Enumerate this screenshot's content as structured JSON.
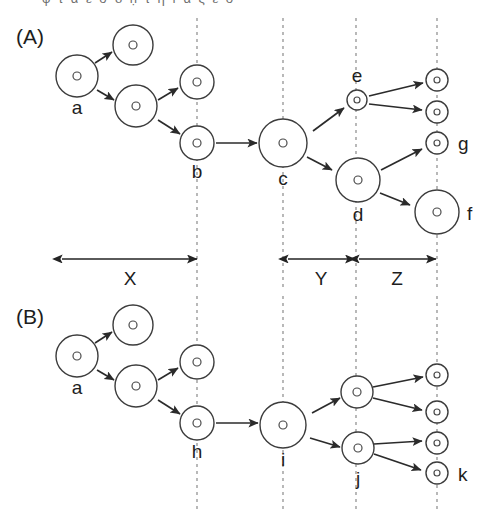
{
  "figure": {
    "width": 491,
    "height": 510,
    "background": "#ffffff",
    "stroke_color": "#2b2b2b",
    "guide_color": "#8a8a8a",
    "clipped_header_text": "φ  τ  α  ε  σ  δ ḥ τ η ı α ς ε σ"
  },
  "panels": [
    {
      "id": "A",
      "label": "(A)",
      "label_x": 16,
      "label_y": 44,
      "cells": [
        {
          "name": "a",
          "cx": 77,
          "cy": 76,
          "r": 21,
          "nr": 4,
          "label": "a",
          "label_x": 77,
          "label_y": 114,
          "label_anchor": "middle"
        },
        {
          "name": "a-up",
          "cx": 133,
          "cy": 45,
          "r": 20,
          "nr": 4,
          "label": "",
          "label_x": 0,
          "label_y": 0,
          "label_anchor": "middle"
        },
        {
          "name": "a-down",
          "cx": 136,
          "cy": 106,
          "r": 21,
          "nr": 4,
          "label": "",
          "label_x": 0,
          "label_y": 0,
          "label_anchor": "middle"
        },
        {
          "name": "b-sister",
          "cx": 197,
          "cy": 82,
          "r": 17,
          "nr": 4,
          "label": "",
          "label_x": 0,
          "label_y": 0,
          "label_anchor": "middle"
        },
        {
          "name": "b",
          "cx": 197,
          "cy": 143,
          "r": 17,
          "nr": 4,
          "label": "b",
          "label_x": 197,
          "label_y": 178,
          "label_anchor": "middle"
        },
        {
          "name": "c",
          "cx": 283,
          "cy": 143,
          "r": 24,
          "nr": 4,
          "label": "c",
          "label_x": 283,
          "label_y": 185,
          "label_anchor": "middle"
        },
        {
          "name": "e",
          "cx": 357,
          "cy": 100,
          "r": 10,
          "nr": 3,
          "label": "e",
          "label_x": 357,
          "label_y": 82,
          "label_anchor": "middle"
        },
        {
          "name": "d",
          "cx": 358,
          "cy": 180,
          "r": 22,
          "nr": 4,
          "label": "d",
          "label_x": 358,
          "label_y": 221,
          "label_anchor": "middle"
        },
        {
          "name": "e-up",
          "cx": 437,
          "cy": 80,
          "r": 11,
          "nr": 3,
          "label": "",
          "label_x": 0,
          "label_y": 0,
          "label_anchor": "middle"
        },
        {
          "name": "e-down",
          "cx": 437,
          "cy": 112,
          "r": 11,
          "nr": 3,
          "label": "",
          "label_x": 0,
          "label_y": 0,
          "label_anchor": "middle"
        },
        {
          "name": "g",
          "cx": 437,
          "cy": 143,
          "r": 11,
          "nr": 3,
          "label": "g",
          "label_x": 458,
          "label_y": 150,
          "label_anchor": "start"
        },
        {
          "name": "f",
          "cx": 437,
          "cy": 212,
          "r": 22,
          "nr": 4,
          "label": "f",
          "label_x": 467,
          "label_y": 220,
          "label_anchor": "start"
        }
      ],
      "arrows": [
        {
          "name": "a-to-up",
          "x1": 95,
          "y1": 63,
          "x2": 112,
          "y2": 52
        },
        {
          "name": "a-to-down",
          "x1": 97,
          "y1": 90,
          "x2": 114,
          "y2": 100
        },
        {
          "name": "to-b-sister",
          "x1": 158,
          "y1": 100,
          "x2": 178,
          "y2": 88
        },
        {
          "name": "to-b",
          "x1": 158,
          "y1": 120,
          "x2": 180,
          "y2": 134
        },
        {
          "name": "b-to-c",
          "x1": 216,
          "y1": 143,
          "x2": 257,
          "y2": 143
        },
        {
          "name": "c-to-e",
          "x1": 313,
          "y1": 131,
          "x2": 344,
          "y2": 108
        },
        {
          "name": "c-to-d",
          "x1": 307,
          "y1": 157,
          "x2": 332,
          "y2": 170
        },
        {
          "name": "e-to-up",
          "x1": 369,
          "y1": 96,
          "x2": 423,
          "y2": 83
        },
        {
          "name": "e-to-down",
          "x1": 369,
          "y1": 104,
          "x2": 422,
          "y2": 110
        },
        {
          "name": "d-to-g",
          "x1": 381,
          "y1": 170,
          "x2": 422,
          "y2": 149
        },
        {
          "name": "d-to-f",
          "x1": 380,
          "y1": 193,
          "x2": 410,
          "y2": 205
        }
      ]
    },
    {
      "id": "B",
      "label": "(B)",
      "label_x": 16,
      "label_y": 324,
      "cells": [
        {
          "name": "a",
          "cx": 77,
          "cy": 356,
          "r": 21,
          "nr": 4,
          "label": "a",
          "label_x": 77,
          "label_y": 394,
          "label_anchor": "middle"
        },
        {
          "name": "a-up",
          "cx": 133,
          "cy": 325,
          "r": 20,
          "nr": 4,
          "label": "",
          "label_x": 0,
          "label_y": 0,
          "label_anchor": "middle"
        },
        {
          "name": "a-down",
          "cx": 136,
          "cy": 386,
          "r": 21,
          "nr": 4,
          "label": "",
          "label_x": 0,
          "label_y": 0,
          "label_anchor": "middle"
        },
        {
          "name": "h-sister",
          "cx": 197,
          "cy": 362,
          "r": 17,
          "nr": 4,
          "label": "",
          "label_x": 0,
          "label_y": 0,
          "label_anchor": "middle"
        },
        {
          "name": "h",
          "cx": 197,
          "cy": 423,
          "r": 17,
          "nr": 4,
          "label": "h",
          "label_x": 197,
          "label_y": 458,
          "label_anchor": "middle"
        },
        {
          "name": "i",
          "cx": 283,
          "cy": 425,
          "r": 23,
          "nr": 4,
          "label": "i",
          "label_x": 283,
          "label_y": 466,
          "label_anchor": "middle"
        },
        {
          "name": "j-sister",
          "cx": 357,
          "cy": 392,
          "r": 16,
          "nr": 4,
          "label": "",
          "label_x": 0,
          "label_y": 0,
          "label_anchor": "middle"
        },
        {
          "name": "j",
          "cx": 358,
          "cy": 448,
          "r": 16,
          "nr": 4,
          "label": "j",
          "label_x": 358,
          "label_y": 485,
          "label_anchor": "middle"
        },
        {
          "name": "j-s-up",
          "cx": 437,
          "cy": 375,
          "r": 11,
          "nr": 3,
          "label": "",
          "label_x": 0,
          "label_y": 0,
          "label_anchor": "middle"
        },
        {
          "name": "j-s-down",
          "cx": 437,
          "cy": 412,
          "r": 11,
          "nr": 3,
          "label": "",
          "label_x": 0,
          "label_y": 0,
          "label_anchor": "middle"
        },
        {
          "name": "j-up",
          "cx": 437,
          "cy": 443,
          "r": 11,
          "nr": 3,
          "label": "",
          "label_x": 0,
          "label_y": 0,
          "label_anchor": "middle"
        },
        {
          "name": "k",
          "cx": 437,
          "cy": 473,
          "r": 11,
          "nr": 3,
          "label": "k",
          "label_x": 458,
          "label_y": 481,
          "label_anchor": "start"
        }
      ],
      "arrows": [
        {
          "name": "a-to-up",
          "x1": 95,
          "y1": 343,
          "x2": 112,
          "y2": 332
        },
        {
          "name": "a-to-down",
          "x1": 97,
          "y1": 370,
          "x2": 114,
          "y2": 380
        },
        {
          "name": "to-h-sister",
          "x1": 158,
          "y1": 380,
          "x2": 178,
          "y2": 368
        },
        {
          "name": "to-h",
          "x1": 158,
          "y1": 400,
          "x2": 180,
          "y2": 414
        },
        {
          "name": "h-to-i",
          "x1": 216,
          "y1": 423,
          "x2": 258,
          "y2": 423
        },
        {
          "name": "i-to-jsis",
          "x1": 312,
          "y1": 413,
          "x2": 340,
          "y2": 398
        },
        {
          "name": "i-to-j",
          "x1": 310,
          "y1": 438,
          "x2": 340,
          "y2": 447
        },
        {
          "name": "jsis-to-up",
          "x1": 373,
          "y1": 387,
          "x2": 423,
          "y2": 377
        },
        {
          "name": "jsis-to-down",
          "x1": 373,
          "y1": 398,
          "x2": 422,
          "y2": 410
        },
        {
          "name": "j-to-up",
          "x1": 374,
          "y1": 444,
          "x2": 422,
          "y2": 441
        },
        {
          "name": "j-to-k",
          "x1": 374,
          "y1": 454,
          "x2": 421,
          "y2": 470
        }
      ]
    }
  ],
  "guide_lines": [
    {
      "name": "guide-1",
      "x": 197,
      "y1": 18,
      "y2": 288
    },
    {
      "name": "guide-2",
      "x": 283,
      "y1": 18,
      "y2": 288
    },
    {
      "name": "guide-3",
      "x": 356,
      "y1": 18,
      "y2": 288
    },
    {
      "name": "guide-4",
      "x": 437,
      "y1": 18,
      "y2": 288
    },
    {
      "name": "guide-5",
      "x": 197,
      "y1": 296,
      "y2": 510
    },
    {
      "name": "guide-6",
      "x": 283,
      "y1": 296,
      "y2": 510
    },
    {
      "name": "guide-7",
      "x": 356,
      "y1": 296,
      "y2": 510
    },
    {
      "name": "guide-8",
      "x": 437,
      "y1": 296,
      "y2": 510
    }
  ],
  "measurements": [
    {
      "name": "measure-x",
      "label": "X",
      "x1": 62,
      "x2": 197,
      "y": 259,
      "label_x": 130,
      "label_y": 285
    },
    {
      "name": "measure-y",
      "label": "Y",
      "x1": 288,
      "x2": 355,
      "y": 259,
      "label_x": 321,
      "label_y": 285
    },
    {
      "name": "measure-z",
      "label": "Z",
      "x1": 359,
      "x2": 436,
      "y": 259,
      "label_x": 397,
      "label_y": 285
    }
  ]
}
